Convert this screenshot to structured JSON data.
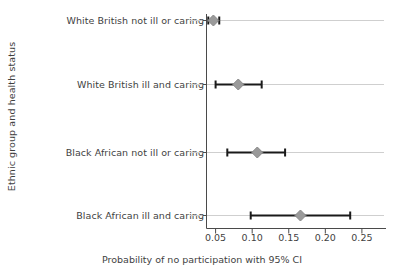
{
  "chart_data": {
    "type": "scatter",
    "title": "",
    "xlabel": "Probability of no participation with 95% CI",
    "ylabel": "Ethnic group and health status",
    "categories": [
      "White British not ill or caring",
      "White British ill and caring",
      "Black African not ill or caring",
      "Black African ill and caring"
    ],
    "values": [
      0.047,
      0.081,
      0.107,
      0.166
    ],
    "ci_low": [
      0.04,
      0.05,
      0.066,
      0.098
    ],
    "ci_high": [
      0.055,
      0.113,
      0.145,
      0.234
    ],
    "xticks": [
      0.05,
      0.1,
      0.15,
      0.2,
      0.25
    ],
    "xtick_labels": [
      "0.05",
      "0.10",
      "0.15",
      "0.20",
      "0.25"
    ],
    "xlim": [
      0.028,
      0.272
    ],
    "grid": true,
    "grid_axis": "y",
    "legend": "none",
    "marker": "diamond",
    "colors": {
      "marker": "#9a9a9a",
      "marker_edge": "#8a8a8a",
      "error_bar": "#1a1a1a",
      "grid": "#cfcfcf",
      "axis": "#4a4a4a",
      "text": "#3f3f3f",
      "background": "#ffffff"
    }
  }
}
